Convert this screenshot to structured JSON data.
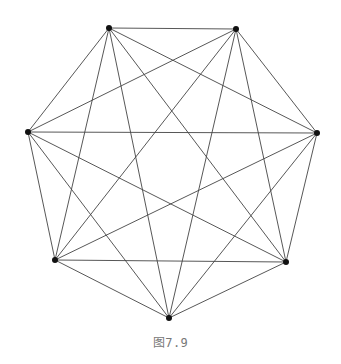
{
  "figure": {
    "type": "complete-graph",
    "name": "K7",
    "caption": "图7.9",
    "edge_color": "#444444",
    "vertex_color": "#111111",
    "vertices": [
      {
        "id": 0,
        "x": 109,
        "y": 28
      },
      {
        "id": 1,
        "x": 236,
        "y": 29
      },
      {
        "id": 2,
        "x": 317,
        "y": 133
      },
      {
        "id": 3,
        "x": 286,
        "y": 262
      },
      {
        "id": 4,
        "x": 169,
        "y": 318
      },
      {
        "id": 5,
        "x": 55,
        "y": 260
      },
      {
        "id": 6,
        "x": 28,
        "y": 132
      }
    ],
    "edges": "all-pairs"
  }
}
